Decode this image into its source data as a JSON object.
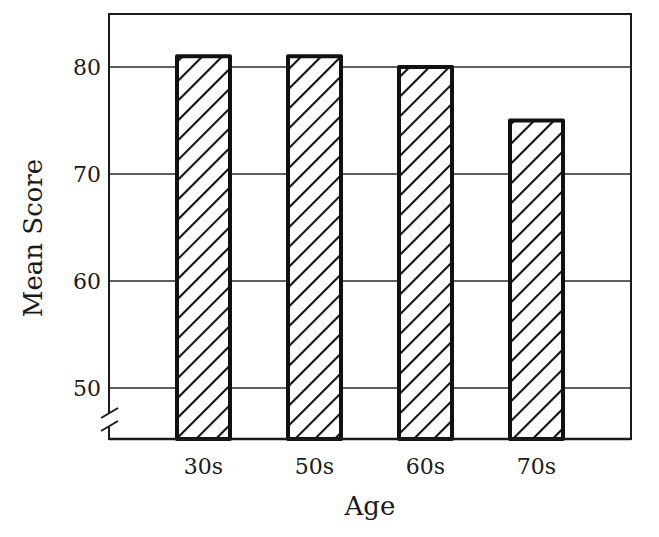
{
  "chart_data": {
    "type": "bar",
    "title": "",
    "xlabel": "Age",
    "ylabel": "Mean Score",
    "categories": [
      "30s",
      "50s",
      "60s",
      "70s"
    ],
    "values": [
      81,
      81,
      80,
      75
    ],
    "ylim": [
      45,
      84
    ],
    "yticks": [
      50,
      60,
      70,
      80
    ],
    "ytick_labels": [
      "50",
      "60",
      "70",
      "80"
    ],
    "y_axis_break": true,
    "grid": {
      "horizontal": true,
      "vertical": false
    },
    "legend": null,
    "bar_style": {
      "fill": "hatched",
      "hatch": "diagonal",
      "edge_color": "#111111",
      "hatch_color": "#111111",
      "background": "#ffffff"
    },
    "frame": "box"
  }
}
